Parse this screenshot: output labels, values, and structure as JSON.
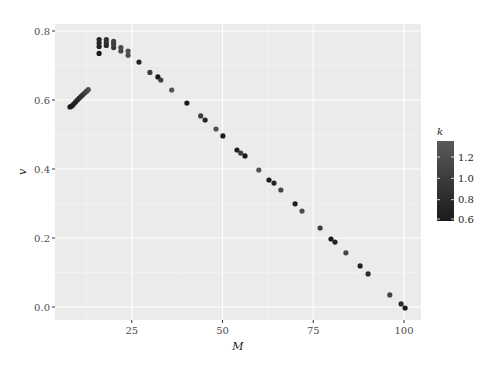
{
  "chart_data": {
    "type": "scatter",
    "title": "",
    "xlabel": "M",
    "ylabel": "v",
    "xlim": [
      4,
      104
    ],
    "ylim": [
      -0.04,
      0.82
    ],
    "x_ticks": [
      25,
      50,
      75,
      100
    ],
    "x_tick_labels": [
      "25",
      "50",
      "75",
      "100"
    ],
    "y_ticks": [
      0.0,
      0.2,
      0.4,
      0.6,
      0.8
    ],
    "y_tick_labels": [
      "0.0",
      "0.2",
      "0.4",
      "0.6",
      "0.8"
    ],
    "grid": true,
    "color_scale": {
      "variable": "k",
      "title": "k",
      "range": [
        0.6,
        1.35
      ],
      "breaks": [
        0.6,
        0.8,
        1.0,
        1.2
      ],
      "break_labels": [
        "0.6",
        "0.8",
        "1.0",
        "1.2"
      ],
      "low_color": "#1a1a1a",
      "high_color": "#5a5a5a"
    },
    "legend_position": "right",
    "points": [
      {
        "M": 8,
        "v": 0.58,
        "k": 0.6
      },
      {
        "M": 8.5,
        "v": 0.583,
        "k": 0.62
      },
      {
        "M": 9,
        "v": 0.588,
        "k": 0.65
      },
      {
        "M": 9.5,
        "v": 0.594,
        "k": 0.7
      },
      {
        "M": 10,
        "v": 0.6,
        "k": 0.75
      },
      {
        "M": 10.5,
        "v": 0.605,
        "k": 0.8
      },
      {
        "M": 11,
        "v": 0.61,
        "k": 0.85
      },
      {
        "M": 11.5,
        "v": 0.615,
        "k": 0.9
      },
      {
        "M": 12,
        "v": 0.62,
        "k": 1.0
      },
      {
        "M": 12.5,
        "v": 0.625,
        "k": 1.1
      },
      {
        "M": 13,
        "v": 0.63,
        "k": 1.2
      },
      {
        "M": 16,
        "v": 0.735,
        "k": 0.6
      },
      {
        "M": 16,
        "v": 0.755,
        "k": 0.65
      },
      {
        "M": 16,
        "v": 0.765,
        "k": 0.7
      },
      {
        "M": 16,
        "v": 0.775,
        "k": 0.75
      },
      {
        "M": 18,
        "v": 0.758,
        "k": 0.8
      },
      {
        "M": 18,
        "v": 0.766,
        "k": 0.85
      },
      {
        "M": 18,
        "v": 0.775,
        "k": 0.9
      },
      {
        "M": 20,
        "v": 0.752,
        "k": 0.95
      },
      {
        "M": 20,
        "v": 0.762,
        "k": 1.0
      },
      {
        "M": 20,
        "v": 0.77,
        "k": 1.05
      },
      {
        "M": 22,
        "v": 0.742,
        "k": 1.1
      },
      {
        "M": 22,
        "v": 0.752,
        "k": 1.15
      },
      {
        "M": 24,
        "v": 0.73,
        "k": 1.2
      },
      {
        "M": 24,
        "v": 0.742,
        "k": 1.25
      },
      {
        "M": 27,
        "v": 0.71,
        "k": 0.7
      },
      {
        "M": 30,
        "v": 0.68,
        "k": 1.0
      },
      {
        "M": 32.2,
        "v": 0.667,
        "k": 0.6
      },
      {
        "M": 33,
        "v": 0.658,
        "k": 1.0
      },
      {
        "M": 36,
        "v": 0.629,
        "k": 1.25
      },
      {
        "M": 40.2,
        "v": 0.591,
        "k": 0.6
      },
      {
        "M": 44,
        "v": 0.554,
        "k": 1.0
      },
      {
        "M": 45.2,
        "v": 0.542,
        "k": 0.7
      },
      {
        "M": 48.2,
        "v": 0.516,
        "k": 1.25
      },
      {
        "M": 50.1,
        "v": 0.496,
        "k": 0.6
      },
      {
        "M": 54,
        "v": 0.455,
        "k": 0.65
      },
      {
        "M": 55,
        "v": 0.446,
        "k": 1.0
      },
      {
        "M": 56.2,
        "v": 0.438,
        "k": 0.6
      },
      {
        "M": 60,
        "v": 0.397,
        "k": 1.25
      },
      {
        "M": 62.8,
        "v": 0.368,
        "k": 0.6
      },
      {
        "M": 64.2,
        "v": 0.359,
        "k": 0.7
      },
      {
        "M": 66.1,
        "v": 0.339,
        "k": 1.1
      },
      {
        "M": 70,
        "v": 0.299,
        "k": 0.65
      },
      {
        "M": 71.9,
        "v": 0.278,
        "k": 1.2
      },
      {
        "M": 76.9,
        "v": 0.229,
        "k": 1.0
      },
      {
        "M": 79.9,
        "v": 0.197,
        "k": 0.6
      },
      {
        "M": 81,
        "v": 0.188,
        "k": 0.7
      },
      {
        "M": 84,
        "v": 0.157,
        "k": 1.1
      },
      {
        "M": 87.9,
        "v": 0.119,
        "k": 0.7
      },
      {
        "M": 90.1,
        "v": 0.096,
        "k": 0.8
      },
      {
        "M": 96.1,
        "v": 0.035,
        "k": 1.1
      },
      {
        "M": 99.2,
        "v": 0.009,
        "k": 0.8
      },
      {
        "M": 100.3,
        "v": -0.003,
        "k": 0.6
      }
    ]
  },
  "labels": {
    "xlabel": "M",
    "ylabel": "v",
    "legend_title": "k"
  }
}
